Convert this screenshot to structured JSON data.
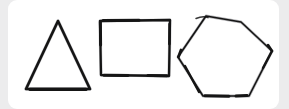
{
  "canvas": {
    "width": 289,
    "height": 109,
    "background_color": "#ececed",
    "card_color": "#ffffff",
    "card_radius": 9,
    "card_x": 8,
    "card_y": 0,
    "card_width": 271,
    "card_height": 109,
    "title": "Hand-drawn geometric shapes"
  },
  "ink": {
    "dark_color": "#151515",
    "light_color": "#8d8d92",
    "mid_color": "#4a4a50"
  },
  "shapes": [
    {
      "id": "triangle",
      "name": "triangle",
      "sides": 3,
      "label": "Triangle",
      "stroke_color": "#151515",
      "stroke_width": 2.6,
      "bbox": {
        "x": 25,
        "y": 20,
        "width": 66,
        "height": 71
      },
      "vertices": [
        {
          "x": 58,
          "y": 21
        },
        {
          "x": 90,
          "y": 89
        },
        {
          "x": 26,
          "y": 89
        }
      ],
      "points": "58,21 90,89 26,89"
    },
    {
      "id": "square",
      "name": "square",
      "sides": 4,
      "label": "Square",
      "stroke_color": "#151515",
      "stroke_width": 2.4,
      "bbox": {
        "x": 100,
        "y": 20,
        "width": 70,
        "height": 56
      },
      "vertices": [
        {
          "x": 100,
          "y": 21
        },
        {
          "x": 170,
          "y": 20
        },
        {
          "x": 169,
          "y": 76
        },
        {
          "x": 101,
          "y": 75
        }
      ],
      "points": "100,21 170,20 169,76 101,75"
    },
    {
      "id": "hexagon",
      "name": "hexagon",
      "sides": 6,
      "label": "Hexagon",
      "stroke_color": "#151515",
      "stroke_width": 2.2,
      "bbox": {
        "x": 177,
        "y": 16,
        "width": 96,
        "height": 81
      },
      "vertices": [
        {
          "x": 206,
          "y": 16
        },
        {
          "x": 241,
          "y": 22
        },
        {
          "x": 272,
          "y": 51
        },
        {
          "x": 249,
          "y": 96
        },
        {
          "x": 203,
          "y": 96
        },
        {
          "x": 178,
          "y": 57
        }
      ],
      "points": "206,16 241,22 272,51 249,96 203,96 178,57"
    }
  ],
  "figure": {
    "shape_count": 3,
    "caption": ""
  }
}
